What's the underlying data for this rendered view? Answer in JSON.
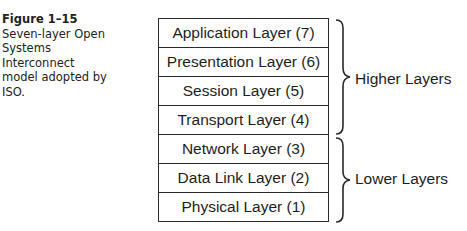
{
  "caption": {
    "figure_label": "Figure 1–15",
    "text": "Seven-layer Open Systems Interconnect model adopted by ISO."
  },
  "layers": [
    {
      "label": "Application Layer (7)"
    },
    {
      "label": "Presentation Layer (6)"
    },
    {
      "label": "Session Layer (5)"
    },
    {
      "label": "Transport Layer (4)"
    },
    {
      "label": "Network Layer (3)"
    },
    {
      "label": "Data Link Layer (2)"
    },
    {
      "label": "Physical Layer (1)"
    }
  ],
  "groups": [
    {
      "label": "Higher Layers",
      "spans": "Application–Transport"
    },
    {
      "label": "Lower Layers",
      "spans": "Network–Physical"
    }
  ]
}
